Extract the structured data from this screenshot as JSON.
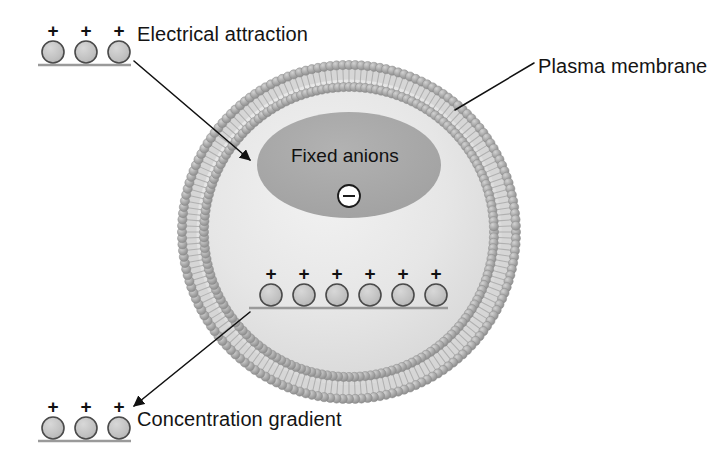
{
  "diagram": {
    "background_color": "#ffffff",
    "labels": {
      "electrical_attraction": "Electrical attraction",
      "plasma_membrane": "Plasma membrane",
      "concentration_gradient": "Concentration gradient",
      "fixed_anions": "Fixed anions"
    },
    "cell": {
      "center_x": 349,
      "center_y": 232,
      "outer_radius": 172,
      "membrane_thickness": 22,
      "interior_fill": "#e2e2e2",
      "interior_highlight": "#efefef",
      "membrane_head_color": "#9a9a9a",
      "membrane_head_highlight": "#c9c9c9",
      "membrane_tail_color": "#b4b4b4",
      "membrane_core_color": "#d8d8d8"
    },
    "fixed_anion_region": {
      "label": "Fixed anions",
      "center_x": 349,
      "center_y": 165,
      "rx": 92,
      "ry": 53,
      "fill": "#a8a8a8",
      "charge_symbol": "−",
      "charge_badge_fill": "#ffffff",
      "charge_badge_stroke": "#1b1b1b",
      "charge_badge_radius": 11
    },
    "ion_groups": [
      {
        "name": "outside-top-left",
        "location": "extracellular",
        "count": 3,
        "charge": "+",
        "baseline_y": 52,
        "start_x": 53,
        "spacing": 33,
        "radius": 11,
        "line_from_x": 38,
        "line_to_x": 131,
        "fill": "#c2c2c2",
        "stroke": "#4a4a4a"
      },
      {
        "name": "inside-middle",
        "location": "intracellular",
        "count": 6,
        "charge": "+",
        "baseline_y": 295,
        "start_x": 271,
        "spacing": 33,
        "radius": 11,
        "line_from_x": 249,
        "line_to_x": 448,
        "fill": "#c2c2c2",
        "stroke": "#4a4a4a"
      },
      {
        "name": "outside-bottom-left",
        "location": "extracellular",
        "count": 3,
        "charge": "+",
        "baseline_y": 428,
        "start_x": 53,
        "spacing": 33,
        "radius": 11,
        "line_from_x": 38,
        "line_to_x": 131,
        "fill": "#c2c2c2",
        "stroke": "#4a4a4a"
      }
    ],
    "arrows": [
      {
        "name": "electrical-attraction-arrow",
        "from_x": 134,
        "from_y": 61,
        "to_x": 250,
        "to_y": 160,
        "color": "#111111",
        "width": 1.6,
        "head": "filled"
      },
      {
        "name": "concentration-gradient-arrow",
        "from_x": 250,
        "from_y": 312,
        "to_x": 134,
        "to_y": 406,
        "color": "#111111",
        "width": 1.6,
        "head": "filled"
      },
      {
        "name": "plasma-membrane-leader",
        "from_x": 534,
        "from_y": 63,
        "to_x": 455,
        "to_y": 110,
        "color": "#111111",
        "width": 1.5,
        "head": "none"
      }
    ]
  }
}
